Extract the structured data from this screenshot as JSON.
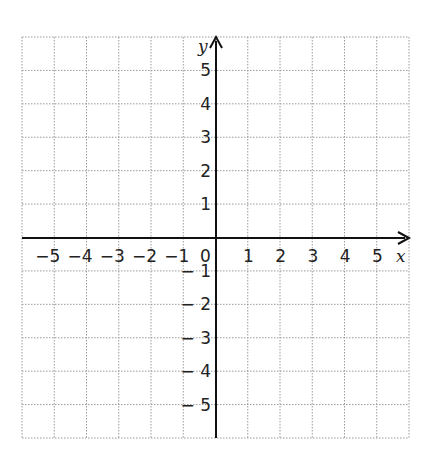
{
  "diagram": {
    "type": "cartesian-coordinate-grid",
    "x_axis": {
      "label": "x",
      "range": [
        -6,
        6
      ],
      "tick_labels": [
        "-5",
        "-4",
        "-3",
        "-2",
        "-1",
        "1",
        "2",
        "3",
        "4",
        "5"
      ],
      "origin_label": "0"
    },
    "y_axis": {
      "label": "y",
      "range": [
        -6,
        6
      ],
      "tick_labels": [
        "5",
        "4",
        "3",
        "2",
        "1",
        "-1",
        "-2",
        "-3",
        "-4",
        "-5"
      ]
    },
    "grid": {
      "columns": 12,
      "rows": 12,
      "line_style": "dotted",
      "line_color": "#9a9a9a"
    },
    "axis_color": "#111111"
  },
  "chart_data": {
    "type": "scatter",
    "title": "",
    "xlabel": "x",
    "ylabel": "y",
    "xlim": [
      -6,
      6
    ],
    "ylim": [
      -6,
      6
    ],
    "x_ticks": [
      -5,
      -4,
      -3,
      -2,
      -1,
      0,
      1,
      2,
      3,
      4,
      5
    ],
    "y_ticks": [
      -5,
      -4,
      -3,
      -2,
      -1,
      1,
      2,
      3,
      4,
      5
    ],
    "grid": true,
    "series": []
  }
}
